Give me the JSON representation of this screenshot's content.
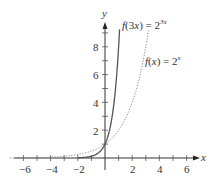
{
  "chart_data": {
    "type": "line",
    "title": "",
    "xlabel": "x",
    "ylabel": "y",
    "xlim": [
      -7,
      7
    ],
    "ylim": [
      -0.5,
      9.5
    ],
    "x_ticks": [
      -6,
      -4,
      -2,
      2,
      4,
      6
    ],
    "y_ticks": [
      2,
      4,
      6,
      8
    ],
    "grid": false,
    "series": [
      {
        "name": "f(3x) = 2^(3x)",
        "style": "solid",
        "color": "#555555",
        "function": "2^(3x)",
        "x_range": [
          -2,
          1.07
        ]
      },
      {
        "name": "f(x) = 2^x",
        "style": "dotted",
        "color": "#777777",
        "function": "2^x",
        "x_range": [
          -7,
          3.2
        ]
      }
    ],
    "annotations": [
      {
        "text": "f(3x) = 2^3x",
        "near_series": 0
      },
      {
        "text": "f(x) = 2^x",
        "near_series": 1
      }
    ]
  },
  "labels": {
    "x_axis": "x",
    "y_axis": "y",
    "x_ticks": [
      "−6",
      "−4",
      "−2",
      "2",
      "4",
      "6"
    ],
    "y_ticks": [
      "2",
      "4",
      "6",
      "8"
    ],
    "curve1_left": "f",
    "curve1_mid": "(3",
    "curve1_x": "x",
    "curve1_right": ") = 2",
    "curve1_exp": "3x",
    "curve2_left": "f",
    "curve2_mid": "(",
    "curve2_x": "x",
    "curve2_right": ") = 2",
    "curve2_exp": "x"
  }
}
